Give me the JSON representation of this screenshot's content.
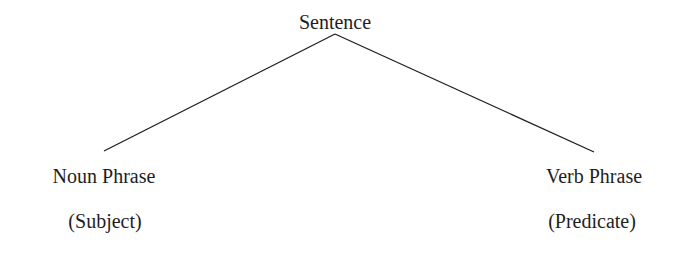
{
  "diagram": {
    "type": "tree",
    "colors": {
      "background": "#ffffff",
      "text": "#1e1e1e",
      "line": "#1e1e1e"
    },
    "root": {
      "label": "Sentence"
    },
    "children": [
      {
        "label": "Noun Phrase",
        "role": "(Subject)"
      },
      {
        "label": "Verb Phrase",
        "role": "(Predicate)"
      }
    ],
    "edges": [
      {
        "from": "Sentence",
        "to": "Noun Phrase"
      },
      {
        "from": "Sentence",
        "to": "Verb Phrase"
      }
    ]
  }
}
